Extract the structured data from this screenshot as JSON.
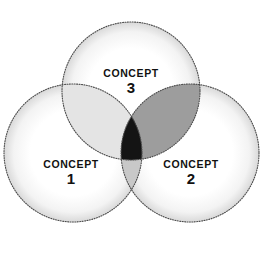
{
  "diagram": {
    "type": "venn-3-circle",
    "background_color": "#ffffff",
    "width": 265,
    "height": 258,
    "border_color": "#4a4a4a",
    "border_style": "dotted"
  },
  "sets": [
    {
      "id": "concept-1",
      "name": "CONCEPT",
      "number": "1",
      "position": "bottom-left",
      "cx": 73,
      "cy": 153,
      "r": 69,
      "fill_color": "#ffffff"
    },
    {
      "id": "concept-2",
      "name": "CONCEPT",
      "number": "2",
      "position": "bottom-right",
      "cx": 190,
      "cy": 153,
      "r": 69,
      "fill_color": "#ffffff"
    },
    {
      "id": "concept-3",
      "name": "CONCEPT",
      "number": "3",
      "position": "top",
      "cx": 131,
      "cy": 91,
      "r": 69,
      "fill_color": "#ffffff"
    }
  ],
  "intersections": [
    {
      "id": "concept-1-and-3",
      "sets": [
        "concept-1",
        "concept-3"
      ],
      "fill_color": "#e4e4e4"
    },
    {
      "id": "concept-1-and-2",
      "sets": [
        "concept-1",
        "concept-2"
      ],
      "fill_color": "#c8c8c8"
    },
    {
      "id": "concept-2-and-3",
      "sets": [
        "concept-2",
        "concept-3"
      ],
      "fill_color": "#9d9d9d"
    },
    {
      "id": "concept-all-three",
      "sets": [
        "concept-1",
        "concept-2",
        "concept-3"
      ],
      "fill_color": "#141414"
    }
  ]
}
